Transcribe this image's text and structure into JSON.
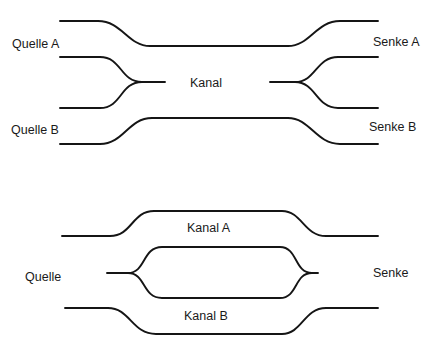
{
  "figure_top": {
    "labels": {
      "source_a": "Quelle A",
      "source_b": "Quelle B",
      "channel": "Kanal",
      "sink_a": "Senke A",
      "sink_b": "Senke B"
    }
  },
  "figure_bottom": {
    "labels": {
      "source": "Quelle",
      "channel_a": "Kanal A",
      "channel_b": "Kanal B",
      "sink": "Senke"
    }
  },
  "colors": {
    "line": "#151515",
    "text": "#1a1a1a",
    "background": "#ffffff"
  }
}
